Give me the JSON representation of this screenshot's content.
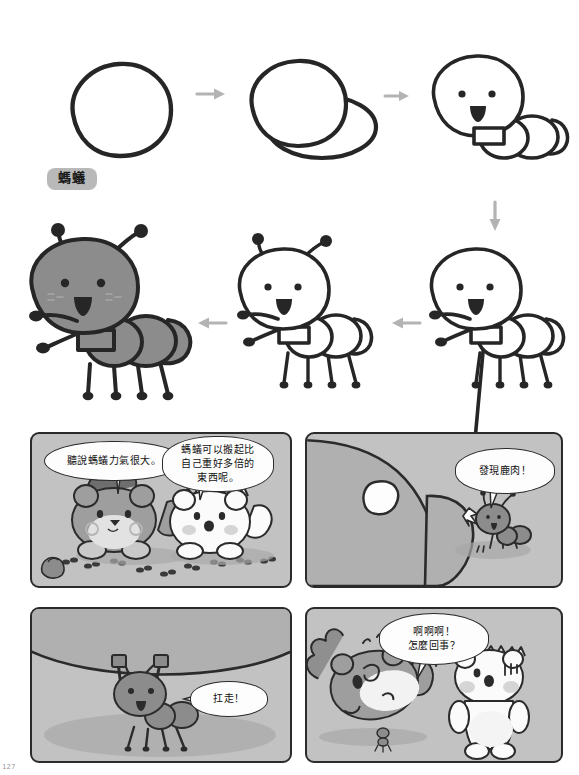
{
  "page": {
    "page_number": "127",
    "background_color": "#ffffff"
  },
  "tutorial": {
    "label": "螞蟻",
    "label_bg": "#b9b9b9",
    "ink_color": "#262626",
    "fill_color": "#8c8c8c",
    "arrow_color": "#b3b3b3",
    "steps": [
      {
        "index": 1,
        "name": "head-blob",
        "caption": ""
      },
      {
        "index": 2,
        "name": "head-and-body",
        "caption": ""
      },
      {
        "index": 3,
        "name": "face-and-segments",
        "caption": ""
      },
      {
        "index": 4,
        "name": "antennae-arms-legs",
        "caption": ""
      },
      {
        "index": 5,
        "name": "full-outline",
        "caption": ""
      },
      {
        "index": 6,
        "name": "colored-ant",
        "caption": ""
      }
    ],
    "arrows": [
      {
        "name": "arrow-step1-to-step2",
        "direction": "right"
      },
      {
        "name": "arrow-step2-to-step3",
        "direction": "right"
      },
      {
        "name": "arrow-step3-to-step4",
        "direction": "down"
      },
      {
        "name": "arrow-step4-to-step5",
        "direction": "left"
      },
      {
        "name": "arrow-step5-to-step6",
        "direction": "left"
      }
    ]
  },
  "comic": {
    "panel_bg": "#c2c2c2",
    "panel_border": "#2b2b2b",
    "panels": [
      {
        "id": 1,
        "name": "panel-1",
        "bubbles": [
          {
            "name": "speech-bubble-squirrel",
            "text": "聽說螞蟻力氣很大。"
          },
          {
            "name": "speech-bubble-bear",
            "text": "螞蟻可以搬起比\n自己重好多倍的\n東西呢。"
          }
        ],
        "characters": [
          "squirrel",
          "bear"
        ],
        "scene": "two animals watching a trail of ants on the ground"
      },
      {
        "id": 2,
        "name": "panel-2",
        "bubbles": [
          {
            "name": "speech-bubble-ant",
            "text": "發現鹿肉！"
          }
        ],
        "characters": [
          "ant",
          "sleeping-squirrel-closeup"
        ],
        "scene": "ant discovers the sleeping squirrel's rump"
      },
      {
        "id": 3,
        "name": "panel-3",
        "bubbles": [
          {
            "name": "speech-bubble-ant-carry",
            "text": "扛走！"
          }
        ],
        "characters": [
          "ant"
        ],
        "scene": "ant lifts the huge body overhead"
      },
      {
        "id": 4,
        "name": "panel-4",
        "bubbles": [
          {
            "name": "speech-bubble-squirrel-panic",
            "text": "啊啊啊！\n怎麼回事？"
          }
        ],
        "characters": [
          "squirrel",
          "bear"
        ],
        "scene": "squirrel carried off by the ant while bear watches"
      }
    ]
  }
}
